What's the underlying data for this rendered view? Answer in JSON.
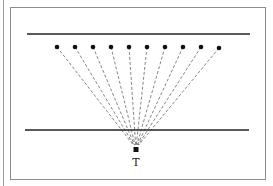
{
  "diagram": {
    "target_label": "T",
    "source_count": 10,
    "colors": {
      "frame": "#8c8c8c",
      "lines": "#222222",
      "dashes": "#333333",
      "points": "#111111"
    }
  }
}
